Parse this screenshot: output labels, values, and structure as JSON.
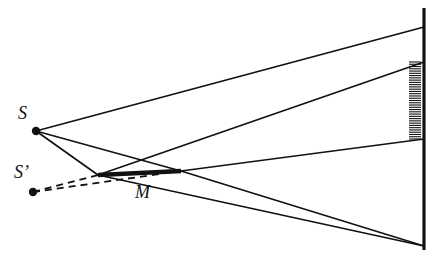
{
  "figure": {
    "domain": "diagram",
    "background_color": "#ffffff",
    "stroke_color": "#111111",
    "labels": {
      "source": "S",
      "image": "S’",
      "mirror": "M"
    },
    "points": {
      "S": {
        "x": 36,
        "y": 131,
        "label": "S",
        "dot_radius": 4.2
      },
      "S_prime": {
        "x": 33,
        "y": 192,
        "label": "S’",
        "dot_radius": 4.2
      },
      "mirror_left": {
        "x": 98,
        "y": 175
      },
      "mirror_right": {
        "x": 181,
        "y": 171
      },
      "screen_top": {
        "x": 424,
        "y": 8
      },
      "screen_bottom": {
        "x": 424,
        "y": 250
      }
    },
    "screen": {
      "name": "vertical-screen",
      "x": 424,
      "y_top": 8,
      "y_bottom": 250,
      "thickness": 3.2
    },
    "hatching": {
      "name": "illuminated-band",
      "x_right": 421,
      "x_left": 409,
      "y_top": 62,
      "y_bottom": 139,
      "tick_count": 34,
      "tick_thickness": 1.1
    },
    "mirror": {
      "name": "plane-mirror",
      "x1": 98,
      "y1": 175,
      "x2": 181,
      "y2": 171,
      "thickness": 4.6
    },
    "solid_rays": [
      {
        "name": "direct-ray-upper",
        "x1": 36,
        "y1": 131,
        "x2": 424,
        "y2": 27
      },
      {
        "name": "incident-ray-to-mirror-left",
        "x1": 36,
        "y1": 131,
        "x2": 98,
        "y2": 175
      },
      {
        "name": "incident-ray-to-mirror-right",
        "x1": 36,
        "y1": 131,
        "x2": 181,
        "y2": 171
      },
      {
        "name": "reflected-ray-from-mirror-left",
        "x1": 98,
        "y1": 175,
        "x2": 424,
        "y2": 62
      },
      {
        "name": "reflected-ray-from-mirror-right",
        "x1": 181,
        "y1": 171,
        "x2": 424,
        "y2": 139
      },
      {
        "name": "direct-ray-lower",
        "x1": 98,
        "y1": 175,
        "x2": 424,
        "y2": 246
      },
      {
        "name": "direct-ray-lower-extension",
        "x1": 181,
        "y1": 171,
        "x2": 424,
        "y2": 246
      }
    ],
    "dashed_rays": [
      {
        "name": "virtual-ray-to-mirror-left",
        "x1": 33,
        "y1": 192,
        "x2": 98,
        "y2": 175
      },
      {
        "name": "virtual-ray-to-mirror-right",
        "x1": 33,
        "y1": 192,
        "x2": 181,
        "y2": 171
      }
    ],
    "dash_pattern": "7 5"
  }
}
